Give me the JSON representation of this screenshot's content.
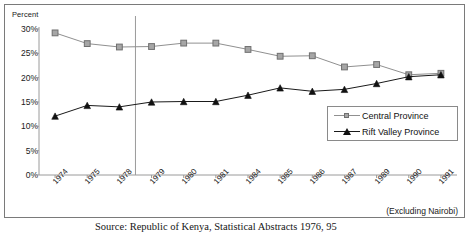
{
  "chart_data": {
    "type": "line",
    "title": "",
    "ylabel": "Percent",
    "xlabel": "",
    "ylim": [
      0,
      30
    ],
    "ytick_labels": [
      "30%",
      "25%",
      "20%",
      "15%",
      "10%",
      "5%",
      "0%"
    ],
    "ytick_values": [
      30,
      25,
      20,
      15,
      10,
      5,
      0
    ],
    "grid": false,
    "legend_position": "center-right",
    "categories": [
      "1974",
      "1975",
      "1978",
      "1979",
      "1980",
      "1981",
      "1984",
      "1985",
      "1986",
      "1987",
      "1989",
      "1990",
      "1991"
    ],
    "series": [
      {
        "name": "Central Province",
        "marker": "square",
        "color": "#909090",
        "marker_color": "#a6a6a6",
        "values": [
          29.2,
          27.0,
          26.3,
          26.4,
          27.1,
          27.1,
          25.8,
          24.4,
          24.5,
          22.2,
          22.7,
          20.6,
          20.9
        ]
      },
      {
        "name": "Rift Valley Province",
        "marker": "triangle",
        "color": "#1a1a1a",
        "marker_color": "#111111",
        "values": [
          12.1,
          14.3,
          14.0,
          15.0,
          15.1,
          15.1,
          16.4,
          17.9,
          17.2,
          17.6,
          18.8,
          20.2,
          20.6
        ]
      }
    ],
    "annotations": [
      {
        "name": "vertical-divider",
        "x_between": [
          "1978",
          "1979"
        ]
      }
    ],
    "footnote": "(Excluding Nairobi)",
    "source": "Source: Republic of Kenya, Statistical Abstracts 1976, 95"
  },
  "legend": {
    "items": [
      {
        "label": "Central Province"
      },
      {
        "label": "Rift Valley Province"
      }
    ]
  },
  "colors": {
    "central": "#909090",
    "rift": "#1a1a1a",
    "frame": "#7a7a7a",
    "axis": "#9a9a9a"
  }
}
